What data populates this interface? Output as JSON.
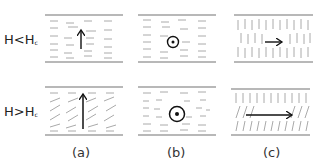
{
  "rows": [
    {
      "label_main": "H<H",
      "label_sub": "c"
    },
    {
      "label_main": "H>H",
      "label_sub": "c"
    }
  ],
  "captions": [
    "(a)",
    "(b)",
    "(c)"
  ],
  "panels": {
    "a": {
      "description": "planar LC cell, arrow field perpendicular (up); above threshold molecules tilt",
      "arrow": "up"
    },
    "b": {
      "description": "planar LC cell, field out of plane (dot-circle symbol)",
      "arrow": "out-of-plane"
    },
    "c": {
      "description": "homeotropic LC cell, field horizontal (right)",
      "arrow": "right"
    }
  },
  "colors": {
    "plate": "#b8b8b8",
    "molecule": "#a8a8a8",
    "arrow": "#111111",
    "text": "#222222"
  }
}
